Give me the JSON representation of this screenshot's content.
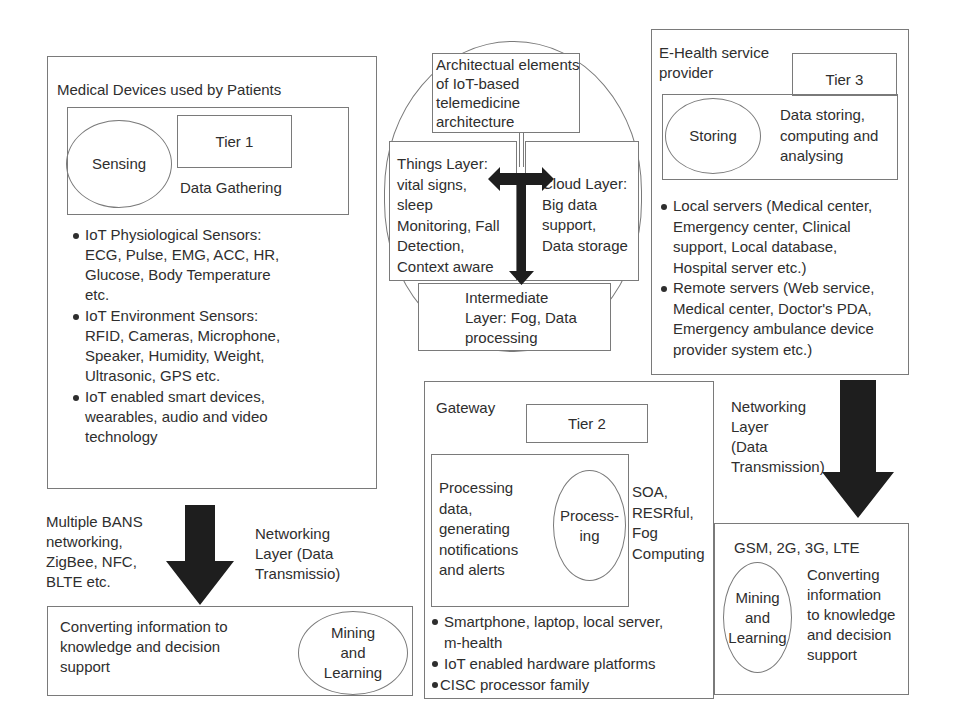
{
  "tier1": {
    "title": "Medical  Devices used by Patients",
    "ellipse": "Sensing",
    "tier_label": "Tier 1",
    "function": "Data Gathering",
    "bullets": [
      "IoT Physiological Sensors:\nECG, Pulse, EMG, ACC, HR,\nGlucose, Body Temperature\n etc.",
      "IoT Environment Sensors:\nRFID, Cameras, Microphone,\nSpeaker, Humidity, Weight,\nUltrasonic, GPS etc.",
      "IoT enabled smart devices,\nwearables, audio and video\ntechnology"
    ]
  },
  "left_network": {
    "left_text": "Multiple BANS\nnetworking,\nZigBee, NFC,\nBLTE etc.",
    "right_text": "Networking\nLayer (Data\nTransmissio)"
  },
  "left_bottom": {
    "text": "Converting information to\nknowledge and decision\nsupport",
    "ellipse": "Mining\nand\nLearning"
  },
  "center": {
    "title": "Architectual elements\nof IoT-based\ntelemedicine\narchitecture",
    "things_layer": "Things Layer:\nvital signs,\nsleep\nMonitoring, Fall\nDetection,\nContext aware",
    "cloud_layer": "Cloud Layer:\nBig data\nsupport,\nData storage",
    "intermediate_layer": "Intermediate\nLayer: Fog, Data\nprocessing"
  },
  "tier3": {
    "title": "E-Health service\nprovider",
    "tier_label": "Tier 3",
    "ellipse": "Storing",
    "function": "Data storing,\ncomputing and\nanalysing",
    "bullets": [
      "Local servers (Medical center,\nEmergency center, Clinical\nsupport, Local database,\nHospital server etc.)",
      "Remote servers (Web service,\nMedical center, Doctor's PDA,\nEmergency ambulance device\nprovider system etc.)"
    ]
  },
  "tier2": {
    "title": "Gateway",
    "tier_label": "Tier 2",
    "function": "Processing\ndata,\ngenerating\nnotifications\nand alerts",
    "ellipse": "Process-\ning",
    "protocols": "SOA,\nRESRful,\nFog\nComputing",
    "bullets": [
      "Smartphone, laptop, local server,\nm-health",
      "IoT enabled hardware platforms",
      "CISC processor family"
    ]
  },
  "right_network": {
    "text": "Networking\n Layer\n(Data\nTransmission)"
  },
  "right_bottom": {
    "networks": "GSM, 2G, 3G, LTE",
    "ellipse": "Mining\nand\nLearning",
    "text": "Converting\ninformation\nto knowledge\nand decision\nsupport"
  },
  "colors": {
    "border": "#7a7a7a",
    "arrow": "#1e1e1e",
    "text": "#2e2e2e"
  }
}
